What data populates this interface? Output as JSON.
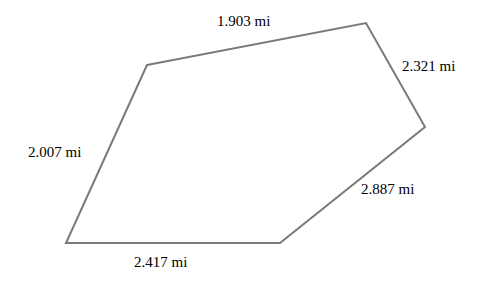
{
  "figure": {
    "width": 485,
    "height": 281,
    "background_color": "#ffffff",
    "stroke_color": "#7a7a7a",
    "stroke_width": 2,
    "text_color": "#000000",
    "unit": "mi",
    "shape": "pentagon"
  },
  "chart_data": {
    "type": "diagram",
    "subtype": "labeled-polygon",
    "title": "",
    "xlabel": "",
    "ylabel": "",
    "grid": false,
    "legend": null,
    "unit": "mi",
    "vertices": [
      {
        "name": "top-left",
        "x": 147,
        "y": 65
      },
      {
        "name": "top-right",
        "x": 366,
        "y": 23
      },
      {
        "name": "right",
        "x": 425,
        "y": 127
      },
      {
        "name": "bottom-right",
        "x": 280,
        "y": 243
      },
      {
        "name": "bottom-left",
        "x": 66,
        "y": 243
      }
    ],
    "polygon_points": "147,65 366,23 425,127 280,243 66,243",
    "edges": [
      {
        "name": "top-edge",
        "from": "top-left",
        "to": "top-right",
        "length": 1.903,
        "label": "1.903 mi"
      },
      {
        "name": "upper-right-edge",
        "from": "top-right",
        "to": "right",
        "length": 2.321,
        "label": "2.321 mi"
      },
      {
        "name": "lower-right-edge",
        "from": "right",
        "to": "bottom-right",
        "length": 2.887,
        "label": "2.887 mi"
      },
      {
        "name": "bottom-edge",
        "from": "bottom-right",
        "to": "bottom-left",
        "length": 2.417,
        "label": "2.417 mi"
      },
      {
        "name": "left-edge",
        "from": "bottom-left",
        "to": "top-left",
        "length": 2.007,
        "label": "2.007 mi"
      }
    ],
    "labels": [
      "1.903 mi",
      "2.321 mi",
      "2.887 mi",
      "2.417 mi",
      "2.007 mi"
    ]
  },
  "labels": {
    "top": "1.903 mi",
    "upper_right": "2.321 mi",
    "lower_right": "2.887 mi",
    "left": "2.007 mi",
    "bottom": "2.417 mi"
  }
}
